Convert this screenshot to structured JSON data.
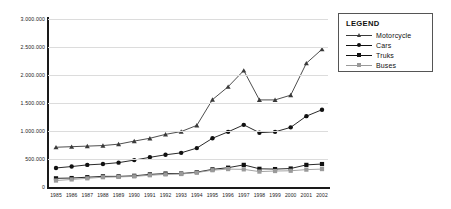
{
  "chart_data": {
    "type": "line",
    "title": "",
    "xlabel": "",
    "ylabel": "",
    "categories": [
      "1985",
      "1986",
      "1987",
      "1988",
      "1989",
      "1990",
      "1991",
      "1992",
      "1993",
      "1994",
      "1995",
      "1996",
      "1997",
      "1998",
      "1999",
      "2000",
      "2001",
      "2002"
    ],
    "ylim": [
      0,
      3000000
    ],
    "ytick_labels": [
      "3.000.000",
      "2.500.000",
      "2.000.000",
      "1.500.000",
      "1.000.000",
      "500.000",
      "0"
    ],
    "ytick_values": [
      3000000,
      2500000,
      2000000,
      1500000,
      1000000,
      500000,
      0
    ],
    "grid": true,
    "legend_position": "right-outside",
    "series": [
      {
        "name": "Motorcycle",
        "marker": "triangle",
        "color": "#3a3a3a",
        "values": [
          710000,
          720000,
          730000,
          740000,
          765000,
          820000,
          870000,
          940000,
          990000,
          1100000,
          1560000,
          1790000,
          2080000,
          1555000,
          1555000,
          1640000,
          2210000,
          2460000
        ]
      },
      {
        "name": "Cars",
        "marker": "circle",
        "color": "#111111",
        "values": [
          340000,
          365000,
          395000,
          410000,
          435000,
          480000,
          530000,
          575000,
          610000,
          695000,
          870000,
          985000,
          1110000,
          970000,
          985000,
          1065000,
          1265000,
          1380000
        ]
      },
      {
        "name": "Truks",
        "marker": "square",
        "color": "#111111",
        "values": [
          155000,
          160000,
          175000,
          190000,
          190000,
          200000,
          225000,
          240000,
          240000,
          265000,
          315000,
          345000,
          395000,
          325000,
          320000,
          330000,
          395000,
          410000
        ]
      },
      {
        "name": "Buses",
        "marker": "square-light",
        "color": "#9a9a9a",
        "values": [
          115000,
          135000,
          155000,
          175000,
          180000,
          190000,
          210000,
          225000,
          232000,
          258000,
          300000,
          320000,
          315000,
          275000,
          285000,
          290000,
          310000,
          320000
        ]
      }
    ]
  },
  "legend": {
    "title": "LEGEND",
    "items": [
      {
        "label": "Motorcycle"
      },
      {
        "label": "Cars"
      },
      {
        "label": "Truks"
      },
      {
        "label": "Buses"
      }
    ]
  }
}
